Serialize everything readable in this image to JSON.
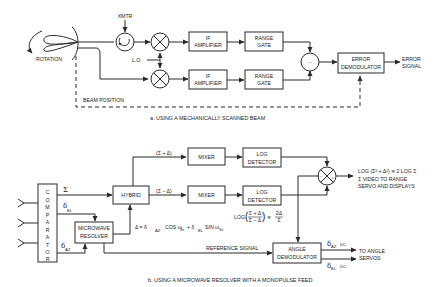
{
  "diagram_a": {
    "caption": "a.  USING A MECHANICALLY SCANNED BEAM",
    "rotation_label": "ROTATION",
    "xmtr_label": "XMTR",
    "lo_label": "L.O.",
    "if_amp_1": [
      "IF",
      "AMPLIFIER"
    ],
    "if_amp_2": [
      "IF",
      "AMPLIFIER"
    ],
    "range_gate_1": [
      "RANGE",
      "GATE"
    ],
    "range_gate_2": [
      "RANGE",
      "GATE"
    ],
    "subtractor_symbol": "−",
    "error_demod": [
      "ERROR",
      "DEMODULATOR"
    ],
    "error_signal": [
      "ERROR",
      "SIGNAL"
    ],
    "beam_position": "BEAM POSITION"
  },
  "diagram_b": {
    "caption": "b.  USING A MICROWAVE RESOLVER WITH A MONOPULSE FEED.",
    "comparator_letters": [
      "C",
      "O",
      "M",
      "P",
      "A",
      "R",
      "A",
      "T",
      "O",
      "R"
    ],
    "sigma": "Σ",
    "delta_el": "δ",
    "delta_el_sub": "EL",
    "delta_az": "δ",
    "delta_az_sub": "AZ",
    "microwave_resolver": [
      "MICROWAVE",
      "RESOLVER"
    ],
    "hybrid": "HYBRID",
    "sum_plus": "(Σ + Δ)",
    "sum_minus": "(Σ − Δ)",
    "mixer_1": "MIXER",
    "mixer_2": "MIXER",
    "log_det_1": [
      "LOG",
      "DETECTOR"
    ],
    "log_det_2": [
      "LOG",
      "DETECTOR"
    ],
    "delta_eq": "Δ = δ",
    "delta_eq_az": "AZ",
    "delta_eq_cos": "COS ω",
    "delta_eq_s1": "S",
    "delta_eq_t1": "t",
    "delta_eq_plus": "+ δ",
    "delta_eq_el": "EL",
    "delta_eq_sin": "SIN ω",
    "delta_eq_s2": "S",
    "delta_eq_t2": "t",
    "log_ratio": "LOG",
    "log_ratio_num": "Σ + Δ",
    "log_ratio_den": "Σ − Δ",
    "log_ratio_approx": "≅",
    "log_ratio_rhs_num": "2Δ",
    "log_ratio_rhs_den": "Σ",
    "combiner_minus": "−",
    "combiner_plus": "+",
    "log_sum_eq": "LOG (Σ² + Δ²) ≅ 2 LOG Σ",
    "video_line_1": "Σ VIDEO TO RANGE",
    "video_line_2": "SERVO AND DISPLAYS",
    "reference_signal": "REFERENCE SIGNAL",
    "angle_demod": [
      "ANGLE",
      "DEMODULATOR"
    ],
    "out_az": "δ",
    "out_az_sub": "AZ",
    "out_az_dc": "DC",
    "out_el": "δ",
    "out_el_sub": "EL",
    "out_el_dc": "DC",
    "to_angle_servos": [
      "TO ANGLE",
      "SERVOS"
    ]
  }
}
